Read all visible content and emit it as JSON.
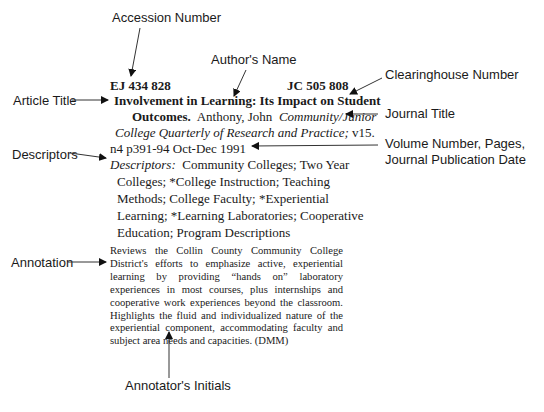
{
  "callouts": {
    "accession_number": "Accession Number",
    "authors_name": "Author's Name",
    "clearinghouse_number": "Clearinghouse Number",
    "article_title": "Article Title",
    "journal_title": "Journal Title",
    "volume_line1": "Volume Number, Pages,",
    "volume_line2": "Journal Publication Date",
    "descriptors": "Descriptors",
    "annotation": "Annotation",
    "annotators_initials": "Annotator's Initials"
  },
  "record": {
    "accession_number": "EJ 434 828",
    "clearinghouse_number": "JC 505 808",
    "title_line1": "Involvement in Learning:  Its Impact on Student",
    "title_line2": "Outcomes.",
    "author": "Anthony, John",
    "journal_line1": "Community/Junior",
    "journal_line2": "College Quarterly of Research and Practice;",
    "volume": "v15.",
    "pages_date": "n4 p391-94 Oct-Dec 1991",
    "descriptors_label": "Descriptors:",
    "descriptors_lines": [
      "Community Colleges; Two Year",
      "Colleges; *College Instruction; Teaching",
      "Methods; College Faculty; *Experiential",
      "Learning; *Learning Laboratories; Cooperative",
      "Education; Program Descriptions"
    ],
    "annotation": "Reviews the Collin County Community College District's efforts to emphasize active, experiential learning by providing “hands on” laboratory experiences in most courses, plus internships and cooperative work experiences beyond the classroom. Highlights the fluid and individualized nature of the experiential component, accommodating faculty and subject area needs and capacities. (DMM)"
  }
}
